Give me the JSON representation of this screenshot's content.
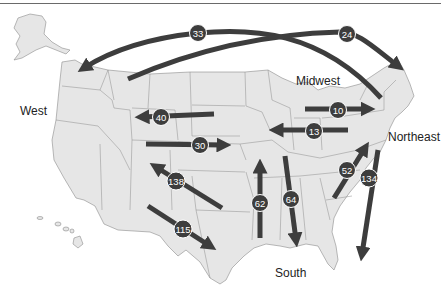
{
  "regions": [
    {
      "label": "West",
      "x": 18,
      "y": 106
    },
    {
      "label": "Midwest",
      "x": 296,
      "y": 75
    },
    {
      "label": "Northeast",
      "x": 387,
      "y": 132
    },
    {
      "label": "South",
      "x": 275,
      "y": 267
    }
  ],
  "flows": [
    {
      "value": "33",
      "from": "Northeast",
      "to": "West",
      "direction": "westward"
    },
    {
      "value": "24",
      "from": "West",
      "to": "Northeast",
      "direction": "eastward"
    },
    {
      "value": "40",
      "from": "Midwest",
      "to": "West",
      "direction": "westward"
    },
    {
      "value": "30",
      "from": "West",
      "to": "Midwest",
      "direction": "eastward"
    },
    {
      "value": "10",
      "from": "Midwest",
      "to": "Northeast",
      "direction": "eastward"
    },
    {
      "value": "13",
      "from": "Northeast",
      "to": "Midwest",
      "direction": "westward"
    },
    {
      "value": "138",
      "from": "South",
      "to": "West",
      "direction": "northwest"
    },
    {
      "value": "115",
      "from": "West",
      "to": "South",
      "direction": "southeast"
    },
    {
      "value": "62",
      "from": "South",
      "to": "Midwest",
      "direction": "north"
    },
    {
      "value": "64",
      "from": "Midwest",
      "to": "South",
      "direction": "south"
    },
    {
      "value": "52",
      "from": "South",
      "to": "Northeast",
      "direction": "northeast"
    },
    {
      "value": "134",
      "from": "Northeast",
      "to": "South",
      "direction": "southwest"
    }
  ],
  "colors": {
    "arrow": "#3d3d3d",
    "land": "#e6e6e6",
    "border": "#8c8c8c",
    "label": "#222222"
  }
}
